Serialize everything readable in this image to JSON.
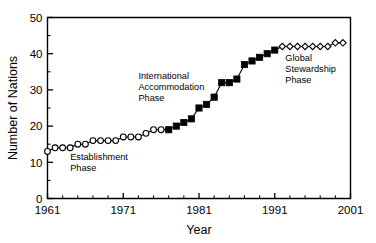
{
  "chart_data": {
    "type": "scatter",
    "title": "",
    "xlabel": "Year",
    "ylabel": "Number of Nations",
    "xlim": [
      1961,
      2001
    ],
    "ylim": [
      0,
      50
    ],
    "x_major_ticks": [
      1961,
      1971,
      1981,
      1991,
      2001
    ],
    "x_tick_labels": [
      "1961",
      "1971",
      "1981",
      "1991",
      "2001"
    ],
    "x_minor_interval": 2,
    "y_major_ticks": [
      0,
      10,
      20,
      30,
      40,
      50
    ],
    "y_tick_labels": [
      "0",
      "10",
      "20",
      "30",
      "40",
      "50"
    ],
    "y_minor_interval": 5,
    "grid": false,
    "legend": "none",
    "series": [
      {
        "name": "Establishment Phase",
        "marker": "open-circle",
        "x": [
          1961,
          1962,
          1963,
          1964,
          1965,
          1966,
          1967,
          1968,
          1969,
          1970,
          1971,
          1972,
          1973,
          1974,
          1975,
          1976
        ],
        "values": [
          13,
          14,
          14,
          14,
          15,
          15,
          16,
          16,
          16,
          16,
          17,
          17,
          17,
          18,
          19,
          19
        ]
      },
      {
        "name": "International Accommodation Phase",
        "marker": "filled-square",
        "x": [
          1977,
          1978,
          1979,
          1980,
          1981,
          1982,
          1983,
          1984,
          1985,
          1986,
          1987,
          1988,
          1989,
          1990,
          1991
        ],
        "values": [
          19,
          20,
          21,
          22,
          25,
          26,
          28,
          32,
          32,
          33,
          37,
          38,
          39,
          40,
          41
        ]
      },
      {
        "name": "Global Stewardship Phase",
        "marker": "open-diamond",
        "x": [
          1992,
          1993,
          1994,
          1995,
          1996,
          1997,
          1998,
          1999,
          2000
        ],
        "values": [
          42,
          42,
          42,
          42,
          42,
          42,
          42,
          43,
          43
        ]
      }
    ],
    "annotations": [
      {
        "id": "establishment",
        "lines": [
          "Establishment",
          "Phase"
        ],
        "x_data": 1964.0,
        "y_data": 10.6
      },
      {
        "id": "international-accommodation",
        "lines": [
          "International",
          "Accommodation",
          "Phase"
        ],
        "x_data": 1973.0,
        "y_data": 33.0
      },
      {
        "id": "global-stewardship",
        "lines": [
          "Global",
          "Stewardship",
          "Phase"
        ],
        "x_data": 1992.4,
        "y_data": 38.0
      }
    ]
  }
}
